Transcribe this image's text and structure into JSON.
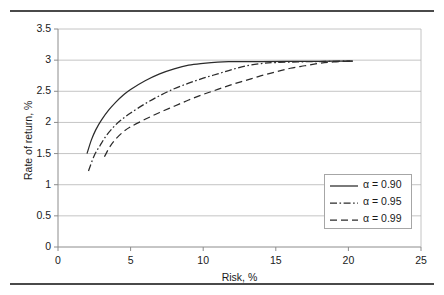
{
  "chart_data": {
    "type": "line",
    "title": "",
    "xlabel": "Risk, %",
    "ylabel": "Rate of return, %",
    "xlim": [
      0,
      25
    ],
    "ylim": [
      0,
      3.5
    ],
    "xticks": [
      "0",
      "5",
      "10",
      "15",
      "20",
      "25"
    ],
    "xtick_values": [
      0,
      5,
      10,
      15,
      20,
      25
    ],
    "yticks": [
      "0",
      "0.5",
      "1",
      "1.5",
      "2",
      "2.5",
      "3",
      "3.5"
    ],
    "ytick_values": [
      0,
      0.5,
      1,
      1.5,
      2,
      2.5,
      3,
      3.5
    ],
    "grid": "horizontal",
    "legend_position": "lower-right",
    "series": [
      {
        "name": "α = 0.90",
        "style": "solid",
        "color": "#2b2b2b",
        "points": [
          [
            2.0,
            1.5
          ],
          [
            2.3,
            1.72
          ],
          [
            2.6,
            1.88
          ],
          [
            3.0,
            2.04
          ],
          [
            3.5,
            2.2
          ],
          [
            4.0,
            2.33
          ],
          [
            4.5,
            2.44
          ],
          [
            5.0,
            2.53
          ],
          [
            6.0,
            2.67
          ],
          [
            7.0,
            2.78
          ],
          [
            8.0,
            2.86
          ],
          [
            9.0,
            2.92
          ],
          [
            10.0,
            2.95
          ],
          [
            11.0,
            2.97
          ],
          [
            12.0,
            2.975
          ],
          [
            14.0,
            2.978
          ],
          [
            16.0,
            2.98
          ],
          [
            18.0,
            2.982
          ],
          [
            20.3,
            2.985
          ]
        ]
      },
      {
        "name": "α = 0.95",
        "style": "dashdot",
        "color": "#2b2b2b",
        "points": [
          [
            2.1,
            1.22
          ],
          [
            2.5,
            1.47
          ],
          [
            2.9,
            1.63
          ],
          [
            3.3,
            1.78
          ],
          [
            3.8,
            1.92
          ],
          [
            4.3,
            2.03
          ],
          [
            5.0,
            2.15
          ],
          [
            6.0,
            2.3
          ],
          [
            7.0,
            2.43
          ],
          [
            8.0,
            2.54
          ],
          [
            9.0,
            2.63
          ],
          [
            10.0,
            2.71
          ],
          [
            11.0,
            2.78
          ],
          [
            12.0,
            2.85
          ],
          [
            13.0,
            2.91
          ],
          [
            14.0,
            2.945
          ],
          [
            15.0,
            2.962
          ],
          [
            16.5,
            2.972
          ],
          [
            18.0,
            2.978
          ],
          [
            20.3,
            2.985
          ]
        ]
      },
      {
        "name": "α = 0.99",
        "style": "dashed",
        "color": "#2b2b2b",
        "points": [
          [
            3.2,
            1.45
          ],
          [
            3.6,
            1.62
          ],
          [
            4.0,
            1.74
          ],
          [
            4.5,
            1.85
          ],
          [
            5.0,
            1.93
          ],
          [
            6.0,
            2.05
          ],
          [
            7.0,
            2.16
          ],
          [
            8.0,
            2.26
          ],
          [
            9.0,
            2.36
          ],
          [
            10.0,
            2.45
          ],
          [
            11.0,
            2.53
          ],
          [
            12.0,
            2.61
          ],
          [
            13.0,
            2.68
          ],
          [
            14.0,
            2.75
          ],
          [
            15.0,
            2.81
          ],
          [
            16.0,
            2.87
          ],
          [
            17.0,
            2.91
          ],
          [
            18.0,
            2.95
          ],
          [
            19.0,
            2.972
          ],
          [
            20.3,
            2.985
          ]
        ]
      }
    ]
  },
  "legend": {
    "entries": [
      {
        "label": "α = 0.90",
        "style": "solid"
      },
      {
        "label": "α = 0.95",
        "style": "dashdot"
      },
      {
        "label": "α = 0.99",
        "style": "dashed"
      }
    ]
  },
  "colors": {
    "line": "#2b2b2b",
    "grid": "#b5b5b5",
    "axis": "#8c8c8c",
    "rule": "#4a4a4a",
    "text": "#1a1a1a"
  }
}
